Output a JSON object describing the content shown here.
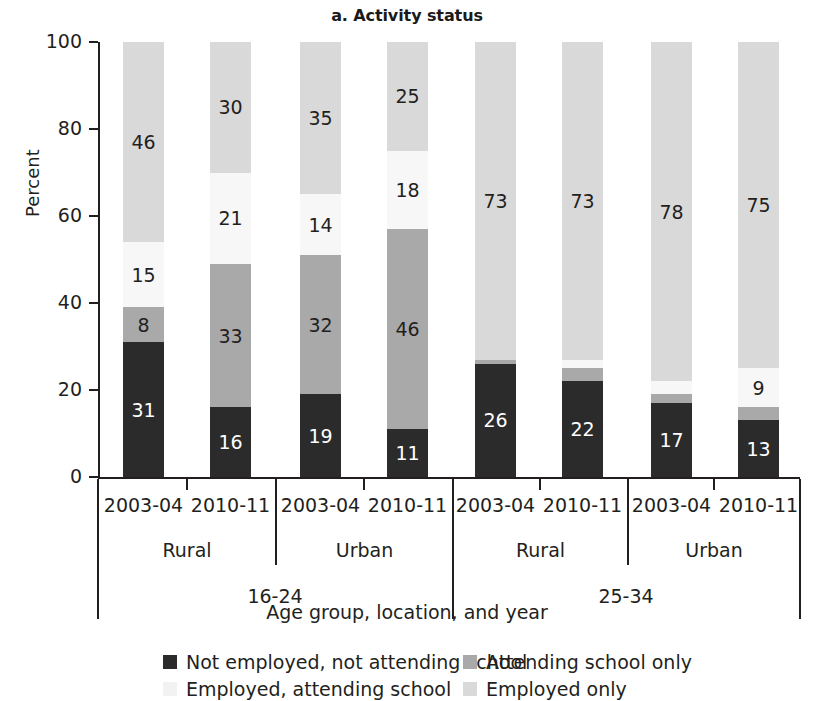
{
  "chart_data": {
    "type": "bar",
    "subtype": "stacked-bar-100-percent",
    "title": "a. Activity status",
    "xlabel": "Age group, location, and year",
    "ylabel": "Percent",
    "ylim": [
      0,
      100
    ],
    "yticks": [
      0,
      20,
      40,
      60,
      80,
      100
    ],
    "grid": false,
    "legend_position": "bottom",
    "categories": [
      "16-24 / Rural / 2003-04",
      "16-24 / Rural / 2010-11",
      "16-24 / Urban / 2003-04",
      "16-24 / Urban / 2010-11",
      "25-34 / Rural / 2003-04",
      "25-34 / Rural / 2010-11",
      "25-34 / Urban / 2003-04",
      "25-34 / Urban / 2010-11"
    ],
    "series": [
      {
        "name": "Not employed, not attending school",
        "color": "#2b2b2b",
        "values": [
          31,
          16,
          19,
          11,
          26,
          22,
          17,
          13
        ]
      },
      {
        "name": "Attending school only",
        "color": "#a9a9a9",
        "values": [
          8,
          33,
          32,
          46,
          1,
          3,
          2,
          3
        ]
      },
      {
        "name": "Employed, attending school",
        "color": "#f7f7f7",
        "values": [
          15,
          21,
          14,
          18,
          0,
          2,
          3,
          9
        ]
      },
      {
        "name": "Employed only",
        "color": "#d9d9d9",
        "values": [
          46,
          30,
          35,
          25,
          73,
          73,
          78,
          75
        ]
      }
    ]
  },
  "title": "a. Activity status",
  "axes": {
    "y_title": "Percent",
    "y_labels": [
      "100",
      "80",
      "60",
      "40",
      "20",
      "0"
    ],
    "x_title": "Age group, location, and year"
  },
  "bars": [
    {
      "id": "bar-1",
      "year": "2003-04",
      "location": "Rural",
      "age": "16-24",
      "segments": [
        {
          "key": "not_employed_not_attending",
          "value": 31,
          "label": "31",
          "color": "#2b2b2b",
          "text_color": "#ffffff",
          "show_label": true
        },
        {
          "key": "attending_only",
          "value": 8,
          "label": "8",
          "color": "#a9a9a9",
          "text_color": "#231f20",
          "show_label": true
        },
        {
          "key": "employed_attending",
          "value": 15,
          "label": "15",
          "color": "#f7f7f7",
          "text_color": "#231f20",
          "show_label": true
        },
        {
          "key": "employed_only",
          "value": 46,
          "label": "46",
          "color": "#d9d9d9",
          "text_color": "#231f20",
          "show_label": true
        }
      ]
    },
    {
      "id": "bar-2",
      "year": "2010-11",
      "location": "Rural",
      "age": "16-24",
      "segments": [
        {
          "key": "not_employed_not_attending",
          "value": 16,
          "label": "16",
          "color": "#2b2b2b",
          "text_color": "#ffffff",
          "show_label": true
        },
        {
          "key": "attending_only",
          "value": 33,
          "label": "33",
          "color": "#a9a9a9",
          "text_color": "#231f20",
          "show_label": true
        },
        {
          "key": "employed_attending",
          "value": 21,
          "label": "21",
          "color": "#f7f7f7",
          "text_color": "#231f20",
          "show_label": true
        },
        {
          "key": "employed_only",
          "value": 30,
          "label": "30",
          "color": "#d9d9d9",
          "text_color": "#231f20",
          "show_label": true
        }
      ]
    },
    {
      "id": "bar-3",
      "year": "2003-04",
      "location": "Urban",
      "age": "16-24",
      "segments": [
        {
          "key": "not_employed_not_attending",
          "value": 19,
          "label": "19",
          "color": "#2b2b2b",
          "text_color": "#ffffff",
          "show_label": true
        },
        {
          "key": "attending_only",
          "value": 32,
          "label": "32",
          "color": "#a9a9a9",
          "text_color": "#231f20",
          "show_label": true
        },
        {
          "key": "employed_attending",
          "value": 14,
          "label": "14",
          "color": "#f7f7f7",
          "text_color": "#231f20",
          "show_label": true
        },
        {
          "key": "employed_only",
          "value": 35,
          "label": "35",
          "color": "#d9d9d9",
          "text_color": "#231f20",
          "show_label": true
        }
      ]
    },
    {
      "id": "bar-4",
      "year": "2010-11",
      "location": "Urban",
      "age": "16-24",
      "segments": [
        {
          "key": "not_employed_not_attending",
          "value": 11,
          "label": "11",
          "color": "#2b2b2b",
          "text_color": "#ffffff",
          "show_label": true
        },
        {
          "key": "attending_only",
          "value": 46,
          "label": "46",
          "color": "#a9a9a9",
          "text_color": "#231f20",
          "show_label": true
        },
        {
          "key": "employed_attending",
          "value": 18,
          "label": "18",
          "color": "#f7f7f7",
          "text_color": "#231f20",
          "show_label": true
        },
        {
          "key": "employed_only",
          "value": 25,
          "label": "25",
          "color": "#d9d9d9",
          "text_color": "#231f20",
          "show_label": true
        }
      ]
    },
    {
      "id": "bar-5",
      "year": "2003-04",
      "location": "Rural",
      "age": "25-34",
      "segments": [
        {
          "key": "not_employed_not_attending",
          "value": 26,
          "label": "26",
          "color": "#2b2b2b",
          "text_color": "#ffffff",
          "show_label": true
        },
        {
          "key": "attending_only",
          "value": 1,
          "label": "",
          "color": "#a9a9a9",
          "text_color": "#231f20",
          "show_label": false
        },
        {
          "key": "employed_attending",
          "value": 0,
          "label": "",
          "color": "#f7f7f7",
          "text_color": "#231f20",
          "show_label": false
        },
        {
          "key": "employed_only",
          "value": 73,
          "label": "73",
          "color": "#d9d9d9",
          "text_color": "#231f20",
          "show_label": true
        }
      ]
    },
    {
      "id": "bar-6",
      "year": "2010-11",
      "location": "Rural",
      "age": "25-34",
      "segments": [
        {
          "key": "not_employed_not_attending",
          "value": 22,
          "label": "22",
          "color": "#2b2b2b",
          "text_color": "#ffffff",
          "show_label": true
        },
        {
          "key": "attending_only",
          "value": 3,
          "label": "",
          "color": "#a9a9a9",
          "text_color": "#231f20",
          "show_label": false
        },
        {
          "key": "employed_attending",
          "value": 2,
          "label": "",
          "color": "#f7f7f7",
          "text_color": "#231f20",
          "show_label": false
        },
        {
          "key": "employed_only",
          "value": 73,
          "label": "73",
          "color": "#d9d9d9",
          "text_color": "#231f20",
          "show_label": true
        }
      ]
    },
    {
      "id": "bar-7",
      "year": "2003-04",
      "location": "Urban",
      "age": "25-34",
      "segments": [
        {
          "key": "not_employed_not_attending",
          "value": 17,
          "label": "17",
          "color": "#2b2b2b",
          "text_color": "#ffffff",
          "show_label": true
        },
        {
          "key": "attending_only",
          "value": 2,
          "label": "",
          "color": "#a9a9a9",
          "text_color": "#231f20",
          "show_label": false
        },
        {
          "key": "employed_attending",
          "value": 3,
          "label": "",
          "color": "#f7f7f7",
          "text_color": "#231f20",
          "show_label": false
        },
        {
          "key": "employed_only",
          "value": 78,
          "label": "78",
          "color": "#d9d9d9",
          "text_color": "#231f20",
          "show_label": true
        }
      ]
    },
    {
      "id": "bar-8",
      "year": "2010-11",
      "location": "Urban",
      "age": "25-34",
      "segments": [
        {
          "key": "not_employed_not_attending",
          "value": 13,
          "label": "13",
          "color": "#2b2b2b",
          "text_color": "#ffffff",
          "show_label": true
        },
        {
          "key": "attending_only",
          "value": 3,
          "label": "",
          "color": "#a9a9a9",
          "text_color": "#231f20",
          "show_label": false
        },
        {
          "key": "employed_attending",
          "value": 9,
          "label": "9",
          "color": "#f7f7f7",
          "text_color": "#231f20",
          "show_label": true
        },
        {
          "key": "employed_only",
          "value": 75,
          "label": "75",
          "color": "#d9d9d9",
          "text_color": "#231f20",
          "show_label": true
        }
      ]
    }
  ],
  "x_groups": {
    "locations": [
      {
        "label": "Rural",
        "age": "16-24"
      },
      {
        "label": "Urban",
        "age": "16-24"
      },
      {
        "label": "Rural",
        "age": "25-34"
      },
      {
        "label": "Urban",
        "age": "25-34"
      }
    ],
    "ages": [
      {
        "label": "16-24"
      },
      {
        "label": "25-34"
      }
    ]
  },
  "legend": {
    "items": [
      {
        "label": "Not employed, not attending school",
        "color": "#2b2b2b"
      },
      {
        "label": "Attending school only",
        "color": "#a9a9a9"
      },
      {
        "label": "Employed, attending school",
        "color": "#f7f7f7"
      },
      {
        "label": "Employed only",
        "color": "#d9d9d9"
      }
    ]
  }
}
